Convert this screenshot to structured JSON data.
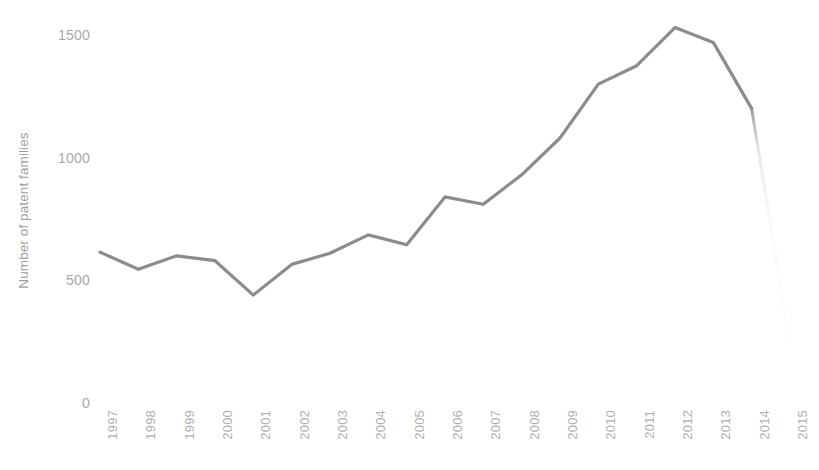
{
  "chart_data": {
    "type": "line",
    "title": "",
    "subtitle": "",
    "xlabel": "",
    "ylabel": "Number of patent families",
    "categories": [
      "1997",
      "1998",
      "1999",
      "2000",
      "2001",
      "2002",
      "2003",
      "2004",
      "2005",
      "2006",
      "2007",
      "2008",
      "2009",
      "2010",
      "2011",
      "2012",
      "2013",
      "2014",
      "2015"
    ],
    "values": [
      615,
      545,
      600,
      580,
      440,
      565,
      610,
      685,
      645,
      840,
      810,
      930,
      1080,
      1300,
      1375,
      1530,
      1470,
      1200,
      235
    ],
    "series": [
      {
        "name": "Number of patent families",
        "color": "#8c8c8c",
        "values": [
          615,
          545,
          600,
          580,
          440,
          565,
          610,
          685,
          645,
          840,
          810,
          930,
          1080,
          1300,
          1375,
          1530,
          1470,
          1200,
          235
        ]
      }
    ],
    "y_ticks": [
      0,
      500,
      1000,
      1500
    ],
    "y_tick_labels": [
      "0",
      "500",
      "1000",
      "1500"
    ],
    "ylim": [
      0,
      1620
    ],
    "xlim": [
      "1997",
      "2015"
    ],
    "grid": false,
    "legend": "none",
    "annotations": [
      {
        "type": "fading-segment",
        "note": "Line fades to near-white between 2014 and 2015 indicating incomplete data",
        "from_category": "2014",
        "to_category": "2015"
      }
    ]
  },
  "style": {
    "line_color": "#8c8c8c",
    "line_width": 3,
    "tick_color": "#a8a8a8",
    "axis_title_color": "#a0a0a0",
    "background": "#ffffff"
  }
}
